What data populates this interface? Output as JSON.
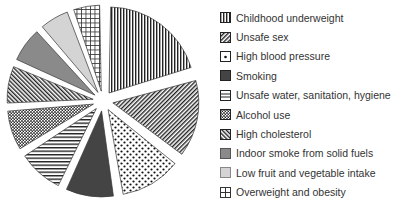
{
  "chart_data": {
    "type": "pie",
    "title": "",
    "exploded": true,
    "legend_position": "right",
    "start_angle_deg": 0,
    "direction": "clockwise",
    "categories": [
      "Childhood underweight",
      "Unsafe sex",
      "High blood pressure",
      "Smoking",
      "Unsafe water, sanitation, hygiene",
      "Alcohol use",
      "High cholesterol",
      "Indoor smoke from solid fuels",
      "Low fruit and vegetable intake",
      "Overweight and obesity"
    ],
    "values": [
      20.5,
      15.0,
      12.0,
      9.5,
      9.0,
      8.0,
      7.5,
      7.0,
      6.0,
      5.5
    ],
    "patterns": [
      "vertical-lines",
      "diagonal-lines-fine",
      "dots",
      "solid-dark",
      "horizontal-lines",
      "checker-dots",
      "diagonal-lines-back",
      "solid-mid-gray",
      "solid-light-gray",
      "grid"
    ]
  },
  "legend": {
    "items": [
      {
        "label": "Childhood underweight"
      },
      {
        "label": "Unsafe sex"
      },
      {
        "label": "High blood pressure"
      },
      {
        "label": "Smoking"
      },
      {
        "label": "Unsafe water, sanitation, hygiene"
      },
      {
        "label": "Alcohol use"
      },
      {
        "label": "High cholesterol"
      },
      {
        "label": "Indoor smoke from solid fuels"
      },
      {
        "label": "Low fruit and vegetable intake"
      },
      {
        "label": "Overweight and obesity"
      }
    ]
  }
}
